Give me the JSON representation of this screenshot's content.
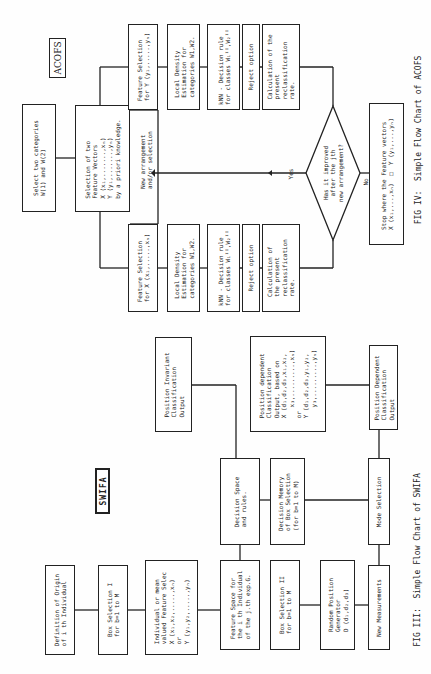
{
  "acofs": {
    "title": "ACOFS",
    "select_categories": "Select two categories\nW(1) and W(2)",
    "selection_vectors": "Selection of two\nFeature Vectors\nX (x₁,.......,xₙ)\nY (y₁,.......,yₙ)\nby a priori knowledge.",
    "new_arrangement": "New arrangement\nand/or selection",
    "branch_y": {
      "feature_selection": "Feature Selection\nfor Y (y₁,.....,yₙ)",
      "local_density": "Local Density\nEstimation for\ncategories W1,W2.",
      "knn": "kNN - Decision rule\nfor classes W₁ᴵᴵ,W₂ᴵᴵ",
      "reject": "Reject option",
      "calculation": "Calculation of the\npresent\nreclassification\nrate."
    },
    "branch_x": {
      "feature_selection": "Feature Selection\nfor X (x₁,.....,xₙ)",
      "local_density": "Local Density\nEstimation for\ncategories W1,W2.",
      "knn": "kNN - Decision rule\nfor classes W₁ᴵᴵ,W₂ᴵᴵ",
      "reject": "Reject option",
      "calculation": "Calculation of\nthe present\nreclassification\nrate."
    },
    "decision": "Has it improved\nafter the jth\nnew arrangement?",
    "yes_label": "Yes",
    "no_label": "No",
    "stop": "Stop where the Feature vectors\nX (x₁,...,xₙ)  □  Y (y₁,...,yₙ)",
    "caption": "FIG IV:  Simple Flow Chart of ACOFS"
  },
  "swifa": {
    "title": "SWIFA",
    "definition_origin": "Definition of Origin\nof i th Individual",
    "box_selection_1": "Box Selection I\nfor b=1 to M",
    "individual_mean": "Individual or mean\nvalued Feature Selec\nX (x₁,x₂,.....,xₙ)\nor\nY (y₁,y₂,.....,yₙ)",
    "position_invariant": "Position Invariant\nClassification\nOutput",
    "feature_space": "Feature Space for\nthe i th Individual\nof the j.th exp.G.",
    "decision_space": "Decision Space\nand rules.",
    "position_dependent_detail": "Position dependent\nClassification\nOutput, based on\nX (d₁,d₂,d₃,x₁,x₂,\n   x₃,.........,xₙ)\nor\nY (d₁,d₂,d₃,y₁,y₂,\n   y₃,.........,yₙ)",
    "box_selection_2": "Box Selection II\nfor b=1 to M",
    "decision_memory": "Decision Memory\nof Box Selection\n(for b=1 to M)",
    "random_position": "Random Position\nGenerator\nD (d₁,d₂,d₃)",
    "new_measurements": "New Measurements",
    "mode_selection": "Mode Selection",
    "position_dependent_output": "Position Dependent\nClassification\nOutput",
    "caption": "FIG III:  Simple Flow Chart of SWIFA"
  }
}
